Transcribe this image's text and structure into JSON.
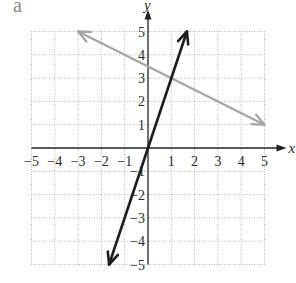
{
  "panel_label": "a",
  "chart_data": {
    "type": "line",
    "title": "",
    "xlabel": "x",
    "ylabel": "y",
    "xlim": [
      -5,
      5
    ],
    "ylim": [
      -5,
      5
    ],
    "grid": true,
    "grid_style": "dotted",
    "x_ticks": [
      "-5",
      "-4",
      "-3",
      "-2",
      "-1",
      "1",
      "2",
      "3",
      "4",
      "5"
    ],
    "y_ticks": [
      "5",
      "4",
      "3",
      "2",
      "1",
      "-1",
      "-2",
      "-3",
      "-4",
      "-5"
    ],
    "series": [
      {
        "name": "gray line",
        "color": "#a6a6a6",
        "equation": "y = -0.5x + 3.5",
        "points": [
          [
            -3,
            5
          ],
          [
            5,
            1
          ]
        ],
        "arrows": "both"
      },
      {
        "name": "black line",
        "color": "#1e1e1e",
        "equation": "y = 3x",
        "points": [
          [
            -1.67,
            -5
          ],
          [
            1.67,
            5
          ]
        ],
        "arrows": "both"
      }
    ],
    "intersection": [
      1,
      3
    ]
  }
}
